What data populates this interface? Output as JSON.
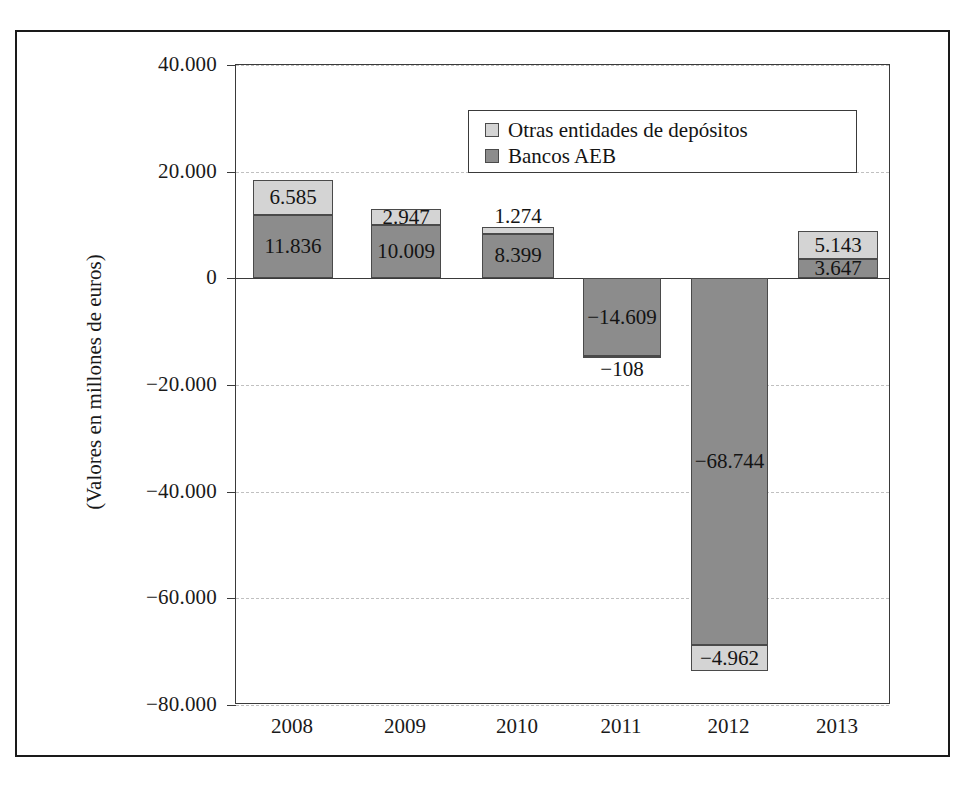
{
  "chart_data": {
    "type": "bar",
    "subtype": "stacked-bar-diverging",
    "title": "",
    "xlabel": "",
    "ylabel": "(Valores en millones de euros)",
    "categories": [
      "2008",
      "2009",
      "2010",
      "2011",
      "2012",
      "2013"
    ],
    "ylim": [
      -80000,
      40000
    ],
    "ytick_labels": [
      "40.000",
      "20.000",
      "0",
      "−20.000",
      "−40.000",
      "−60.000",
      "−80.000"
    ],
    "ytick_values": [
      40000,
      20000,
      0,
      -20000,
      -40000,
      -60000,
      -80000
    ],
    "grid": true,
    "legend_position": "top-center-inside",
    "series": [
      {
        "name": "Otras entidades de depósitos",
        "color": "#d4d4d4",
        "values": [
          6585,
          2947,
          1274,
          -108,
          -4962,
          5143
        ],
        "labels": [
          "6.585",
          "2.947",
          "1.274",
          "−108",
          "−4.962",
          "5.143"
        ]
      },
      {
        "name": "Bancos AEB",
        "color": "#8c8c8c",
        "values": [
          11836,
          10009,
          8399,
          -14609,
          -68744,
          3647
        ],
        "labels": [
          "11.836",
          "10.009",
          "8.399",
          "−14.609",
          "−68.744",
          "3.647"
        ]
      }
    ]
  },
  "legend": {
    "items": [
      {
        "label": "Otras entidades de depósitos",
        "color": "#d4d4d4"
      },
      {
        "label": "Bancos AEB",
        "color": "#8c8c8c"
      }
    ]
  },
  "axis": {
    "y_title": "(Valores en millones de euros)",
    "y_ticks": [
      "40.000",
      "20.000",
      "0",
      "−20.000",
      "−40.000",
      "−60.000",
      "−80.000"
    ],
    "x_ticks": [
      "2008",
      "2009",
      "2010",
      "2011",
      "2012",
      "2013"
    ]
  },
  "colors": {
    "light_gray": "#d4d4d4",
    "dark_gray": "#8c8c8c",
    "frame": "#1a1a1a",
    "axis": "#3a3a3a",
    "grid": "#c0c0c0",
    "text": "#141414",
    "background": "#ffffff"
  }
}
